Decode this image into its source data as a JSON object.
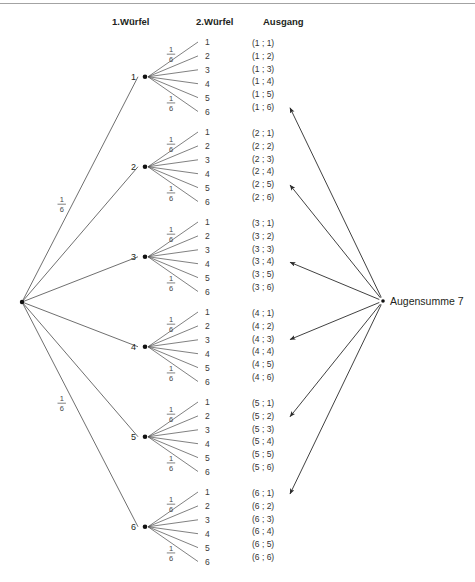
{
  "figure": {
    "type": "probability-tree",
    "title_hidden": "",
    "headers": {
      "stage1": "1.Würfel",
      "stage2": "2.Würfel",
      "outcome": "Ausgang"
    },
    "result_label": "Augensumme 7",
    "probability": {
      "numerator": "1",
      "denominator": "6"
    },
    "stage1_nodes": [
      "1",
      "2",
      "3",
      "4",
      "5",
      "6"
    ],
    "stage2_leaves": [
      "1",
      "2",
      "3",
      "4",
      "5",
      "6"
    ],
    "outcome_groups": [
      {
        "first": "1",
        "outcomes": [
          {
            "text": "(1 ; 1)",
            "highlighted": false
          },
          {
            "text": "(1 ; 2)",
            "highlighted": false
          },
          {
            "text": "(1 ; 3)",
            "highlighted": false
          },
          {
            "text": "(1 ; 4)",
            "highlighted": false
          },
          {
            "text": "(1 ; 5)",
            "highlighted": false
          },
          {
            "text": "(1 ; 6)",
            "highlighted": true
          }
        ]
      },
      {
        "first": "2",
        "outcomes": [
          {
            "text": "(2 ; 1)",
            "highlighted": false
          },
          {
            "text": "(2 ; 2)",
            "highlighted": false
          },
          {
            "text": "(2 ; 3)",
            "highlighted": false
          },
          {
            "text": "(2 ; 4)",
            "highlighted": false
          },
          {
            "text": "(2 ; 5)",
            "highlighted": true
          },
          {
            "text": "(2 ; 6)",
            "highlighted": false
          }
        ]
      },
      {
        "first": "3",
        "outcomes": [
          {
            "text": "(3 ; 1)",
            "highlighted": false
          },
          {
            "text": "(3 ; 2)",
            "highlighted": false
          },
          {
            "text": "(3 ; 3)",
            "highlighted": false
          },
          {
            "text": "(3 ; 4)",
            "highlighted": true
          },
          {
            "text": "(3 ; 5)",
            "highlighted": false
          },
          {
            "text": "(3 ; 6)",
            "highlighted": false
          }
        ]
      },
      {
        "first": "4",
        "outcomes": [
          {
            "text": "(4 ; 1)",
            "highlighted": false
          },
          {
            "text": "(4 ; 2)",
            "highlighted": false
          },
          {
            "text": "(4 ; 3)",
            "highlighted": true
          },
          {
            "text": "(4 ; 4)",
            "highlighted": false
          },
          {
            "text": "(4 ; 5)",
            "highlighted": false
          },
          {
            "text": "(4 ; 6)",
            "highlighted": false
          }
        ]
      },
      {
        "first": "5",
        "outcomes": [
          {
            "text": "(5 ; 1)",
            "highlighted": false
          },
          {
            "text": "(5 ; 2)",
            "highlighted": true
          },
          {
            "text": "(5 ; 3)",
            "highlighted": false
          },
          {
            "text": "(5 ; 4)",
            "highlighted": false
          },
          {
            "text": "(5 ; 5)",
            "highlighted": false
          },
          {
            "text": "(5 ; 6)",
            "highlighted": false
          }
        ]
      },
      {
        "first": "6",
        "outcomes": [
          {
            "text": "(6 ; 1)",
            "highlighted": true
          },
          {
            "text": "(6 ; 2)",
            "highlighted": false
          },
          {
            "text": "(6 ; 3)",
            "highlighted": false
          },
          {
            "text": "(6 ; 4)",
            "highlighted": false
          },
          {
            "text": "(6 ; 5)",
            "highlighted": false
          },
          {
            "text": "(6 ; 6)",
            "highlighted": false
          }
        ]
      }
    ],
    "colors": {
      "line": "#4a4a4a",
      "arrow": "#2b2b2b",
      "text": "#231f20",
      "background": "#ffffff"
    }
  },
  "chart_data": {
    "type": "diagram",
    "stage_labels": [
      "1.Würfel",
      "2.Würfel",
      "Ausgang"
    ],
    "branch_probability": "1/6",
    "branch_probability_value": 0.1667,
    "total_outcomes": 36,
    "highlighted_event": "Augensumme 7",
    "highlighted_outcomes": [
      "(1 ; 6)",
      "(2 ; 5)",
      "(3 ; 4)",
      "(4 ; 3)",
      "(5 ; 2)",
      "(6 ; 1)"
    ],
    "highlighted_count": 6,
    "event_probability": "6/36"
  }
}
